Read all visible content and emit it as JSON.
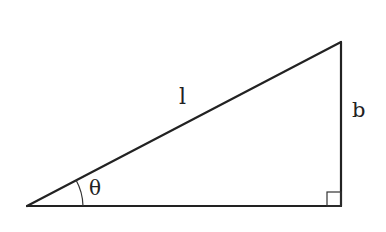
{
  "diagram": {
    "type": "right-triangle",
    "labels": {
      "hypotenuse": "l",
      "opposite": "b",
      "angle": "θ"
    },
    "vertices": {
      "angle_vertex": [
        27,
        206
      ],
      "right_angle_vertex": [
        341,
        206
      ],
      "top_vertex": [
        341,
        42
      ]
    },
    "colors": {
      "stroke": "#222222",
      "background": "#ffffff"
    }
  }
}
